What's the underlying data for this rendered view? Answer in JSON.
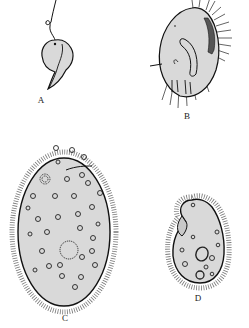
{
  "figure": {
    "panels": [
      {
        "id": "A",
        "label": "A",
        "description": "flagellated comma-shaped cell"
      },
      {
        "id": "B",
        "label": "B",
        "description": "ciliate with cirri and curved oral groove"
      },
      {
        "id": "C",
        "label": "C",
        "description": "large oval ciliate covered in cilia with many vacuoles"
      },
      {
        "id": "D",
        "label": "D",
        "description": "small bean-shaped ciliate with oral groove and vacuoles"
      }
    ]
  },
  "colors": {
    "background": "#ffffff",
    "cell_fill": "#d9d9d9",
    "outline": "#111111"
  }
}
